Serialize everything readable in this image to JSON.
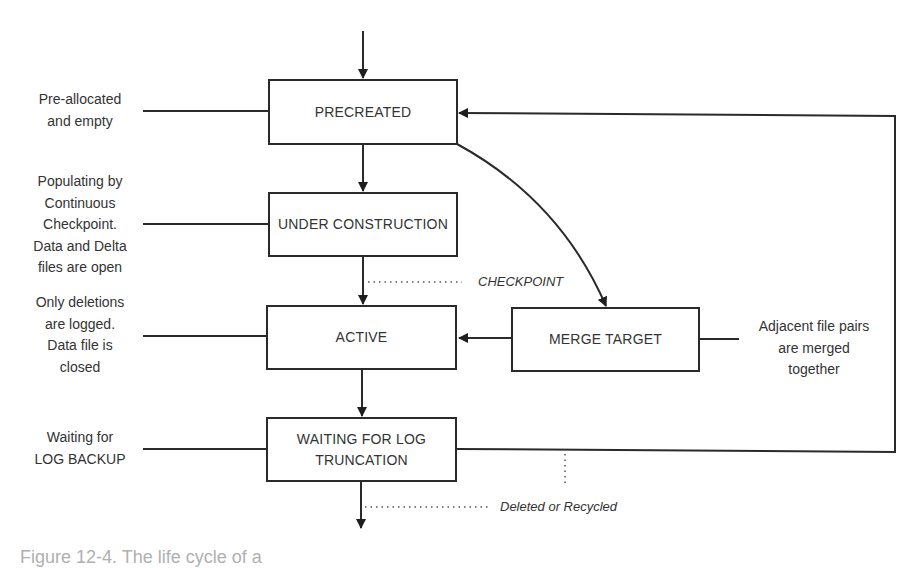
{
  "diagram": {
    "type": "state-flow",
    "states": [
      {
        "id": "precreated",
        "label": "PRECREATED",
        "note": [
          "Pre-allocated",
          "and empty"
        ]
      },
      {
        "id": "under_construction",
        "label": "UNDER CONSTRUCTION",
        "note": [
          "Populating by",
          "Continuous",
          "Checkpoint.",
          "Data and Delta",
          "files are open"
        ]
      },
      {
        "id": "active",
        "label": "ACTIVE",
        "note": [
          "Only deletions",
          "are logged.",
          "Data file is",
          "closed"
        ]
      },
      {
        "id": "waiting",
        "label_lines": [
          "WAITING FOR LOG",
          "TRUNCATION"
        ],
        "note": [
          "Waiting for",
          "LOG BACKUP"
        ]
      },
      {
        "id": "merge_target",
        "label": "MERGE TARGET",
        "note": [
          "Adjacent file pairs",
          "are merged",
          "together"
        ]
      }
    ],
    "transitions": [
      {
        "from": "start",
        "to": "precreated"
      },
      {
        "from": "precreated",
        "to": "under_construction"
      },
      {
        "from": "under_construction",
        "to": "active",
        "label": "CHECKPOINT"
      },
      {
        "from": "precreated",
        "to": "merge_target"
      },
      {
        "from": "merge_target",
        "to": "active"
      },
      {
        "from": "active",
        "to": "waiting"
      },
      {
        "from": "waiting",
        "to": "precreated"
      },
      {
        "from": "waiting",
        "to": "end",
        "label": "Deleted or Recycled"
      }
    ],
    "edge_labels": {
      "checkpoint": "CHECKPOINT",
      "deleted": "Deleted or Recycled"
    },
    "caption_partial": "Figure 12-4. The life cycle of a"
  }
}
